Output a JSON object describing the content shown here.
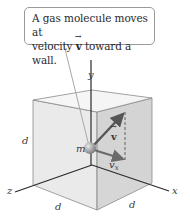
{
  "callout": {
    "line1": "A gas molecule moves at",
    "line2_prefix": "velocity ",
    "line2_vector": "v",
    "line2_suffix": " toward a wall."
  },
  "axes": {
    "x_label": "x",
    "y_label": "y",
    "z_label": "z"
  },
  "cube": {
    "edge_labels": {
      "left_vertical": "d",
      "bottom_left": "d",
      "bottom_right": "d"
    }
  },
  "molecule": {
    "mass_label": "m",
    "velocity_label": "v",
    "velocity_x_label": "v",
    "velocity_x_subscript": "x"
  },
  "colors": {
    "cube_face_light": "#ececec",
    "cube_face_front": "#e3e3e3",
    "cube_face_right": "#d2d2d2",
    "cube_top": "#f4f4f4",
    "edge": "#8c8c8c",
    "axis": "#2b2b2b",
    "arrow": "#555555",
    "molecule": "#9a9a9a"
  }
}
